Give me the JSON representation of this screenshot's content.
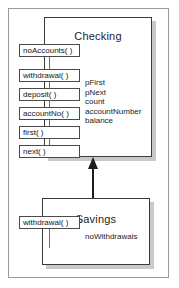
{
  "diagram": {
    "type": "uml-class-diagram",
    "colors": {
      "background": "#ffffff",
      "frame_border": "#9a9a9a",
      "box_border": "#3a3a3a",
      "box_fill": "#ffffff",
      "shadow": "#c9c9c9",
      "text": "#1b1b1b",
      "arrow": "#1d1d1d"
    },
    "classes": [
      {
        "name": "Checking",
        "operations": [
          {
            "label": "withdrawal( )"
          },
          {
            "label": "deposit( )"
          },
          {
            "label": "accountNo( )"
          },
          {
            "label": "first( )"
          },
          {
            "label": "next( )"
          },
          {
            "label": "noAccounts( )"
          }
        ],
        "attributes": [
          {
            "label": "pFirst"
          },
          {
            "label": "pNext"
          },
          {
            "label": "count"
          },
          {
            "label": "accountNumber"
          },
          {
            "label": "balance"
          }
        ]
      },
      {
        "name": "Savings",
        "operations": [
          {
            "label": "withdrawal( )"
          }
        ],
        "attributes": [
          {
            "label": "noWithdrawals"
          }
        ]
      }
    ],
    "relationships": [
      {
        "kind": "generalization",
        "from": "Savings",
        "to": "Checking",
        "arrow_style": "solid-filled-triangle"
      }
    ]
  }
}
